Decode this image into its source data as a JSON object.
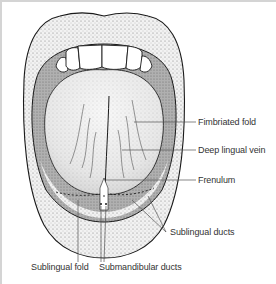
{
  "figure": {
    "labels": {
      "fimbriated_fold": "Fimbriated fold",
      "deep_lingual_vein": "Deep lingual vein",
      "frenulum": "Frenulum",
      "sublingual_ducts": "Sublingual ducts",
      "sublingual_fold": "Sublingual fold",
      "submandibular_ducts": "Submandibular ducts"
    },
    "colors": {
      "outline": "#1a1a1a",
      "lip_stipple": "#c8c8c8",
      "mouth_cavity": "#a9a9a9",
      "tongue": "#eeeeee",
      "leader_line": "#555555",
      "frame": "#d4d4d4"
    }
  }
}
